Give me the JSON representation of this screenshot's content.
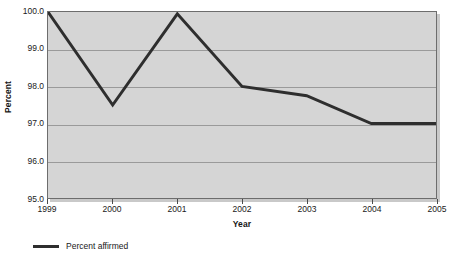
{
  "chart_data": {
    "type": "line",
    "title": "",
    "xlabel": "Year",
    "ylabel": "Percent",
    "x": [
      "1999",
      "2000",
      "2001",
      "2002",
      "2003",
      "2004",
      "2005"
    ],
    "categories": [
      "1999",
      "2000",
      "2001",
      "2002",
      "2003",
      "2004",
      "2005"
    ],
    "series": [
      {
        "name": "Percent affirmed",
        "values": [
          100.0,
          97.5,
          99.95,
          98.0,
          97.75,
          97.0,
          97.0
        ],
        "color": "#2e2e2e"
      }
    ],
    "values": [
      100.0,
      97.5,
      99.95,
      98.0,
      97.75,
      97.0,
      97.0
    ],
    "ylim": [
      95.0,
      100.0
    ],
    "yticks": [
      95.0,
      96.0,
      97.0,
      98.0,
      99.0,
      100.0
    ],
    "ytick_labels": [
      "95.0",
      "96.0",
      "97.0",
      "98.0",
      "99.0",
      "100.0"
    ],
    "xtick_labels": [
      "1999",
      "2000",
      "2001",
      "2002",
      "2003",
      "2004",
      "2005"
    ],
    "grid": true,
    "grid_axis": "y",
    "legend_position": "bottom-left",
    "plot_background": "#d5d5d5",
    "grid_color": "#9a9a9a",
    "axis_color": "#6d6d6d",
    "page_background": "#ffffff"
  },
  "axes": {
    "y_title": "Percent",
    "x_title": "Year"
  },
  "legend": {
    "entries": [
      {
        "label": "Percent affirmed",
        "color": "#2e2e2e"
      }
    ]
  }
}
